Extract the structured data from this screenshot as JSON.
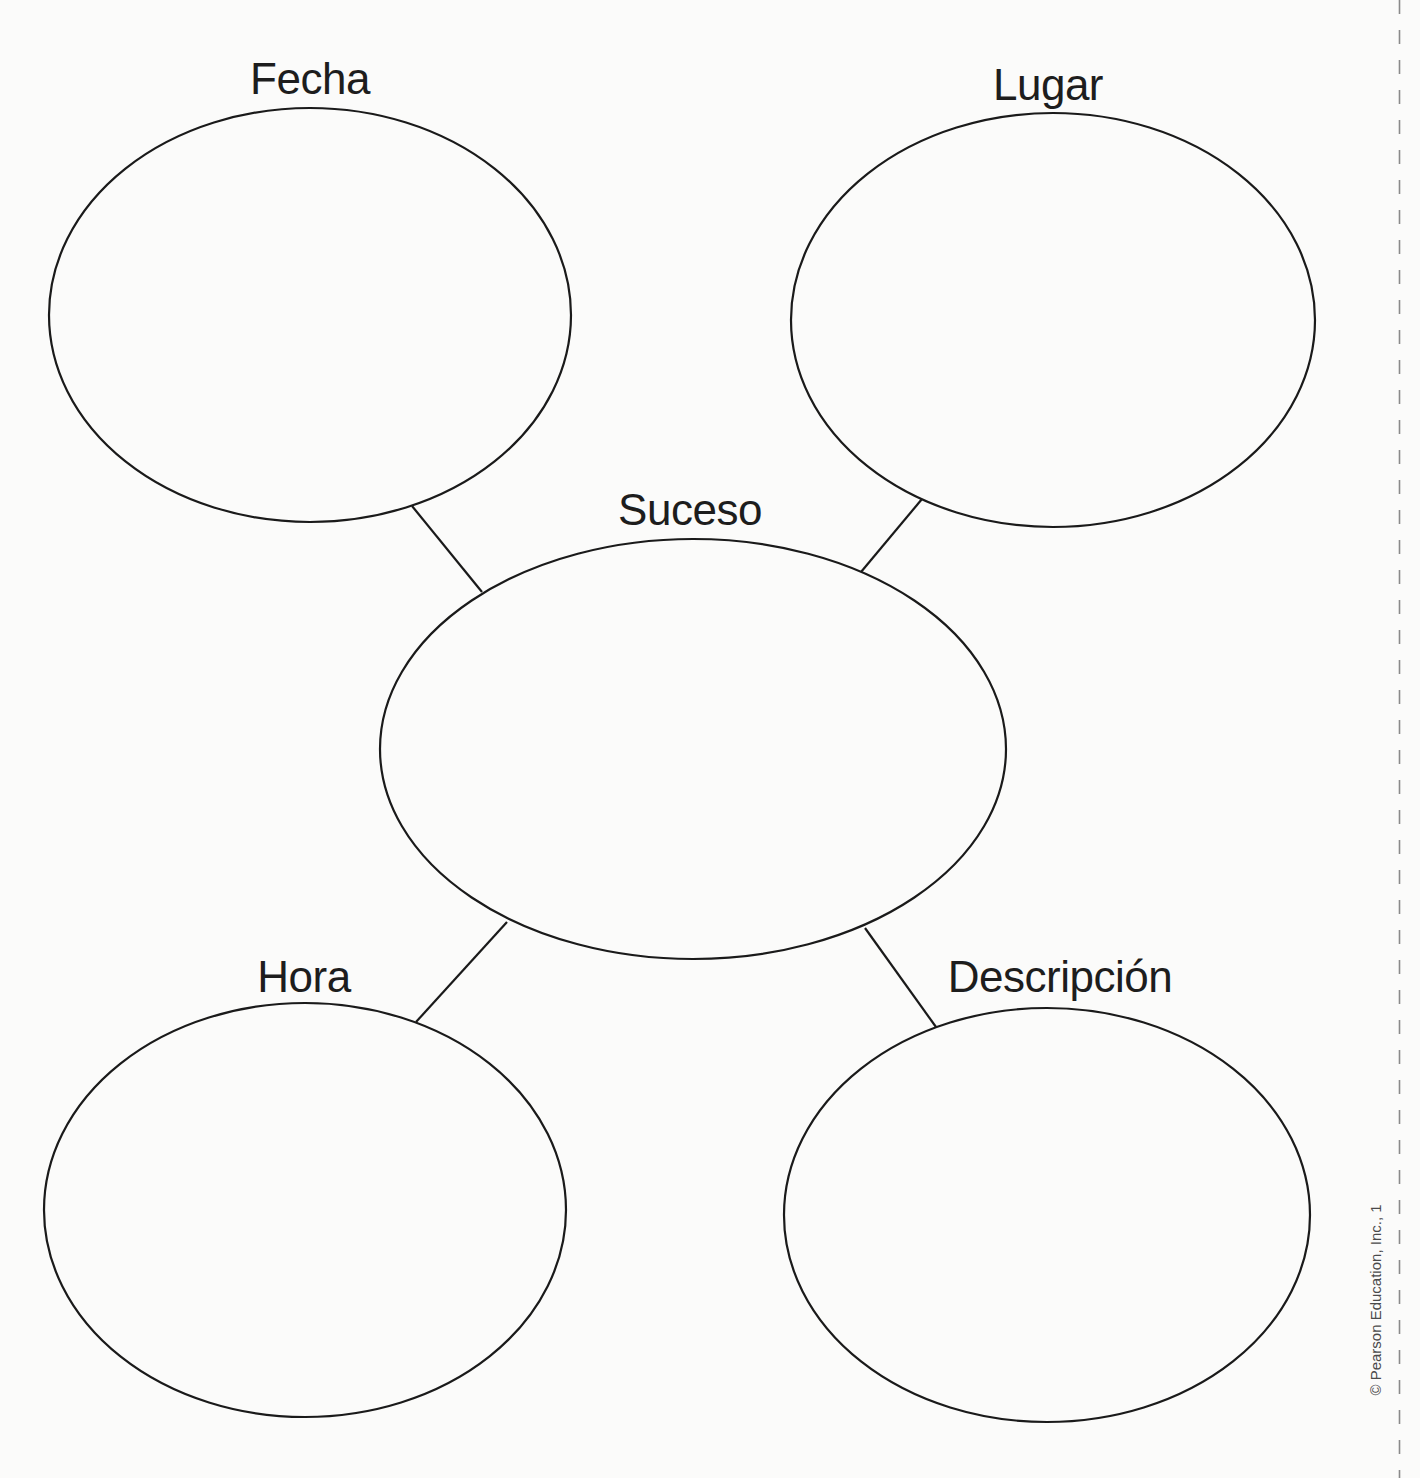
{
  "diagram": {
    "type": "web-graphic-organizer",
    "stroke_color": "#1a1a1a",
    "background_color": "#fbfbfa",
    "center_node": {
      "id": "suceso",
      "label": "Suceso",
      "cx": 693,
      "cy": 749,
      "rx": 313,
      "ry": 210,
      "label_x": 690,
      "label_y": 488
    },
    "outer_nodes": [
      {
        "id": "fecha",
        "label": "Fecha",
        "cx": 310,
        "cy": 315,
        "rx": 261,
        "ry": 207,
        "label_x": 310,
        "label_y": 57,
        "connector": {
          "x1": 412,
          "y1": 506,
          "x2": 482,
          "y2": 592
        }
      },
      {
        "id": "lugar",
        "label": "Lugar",
        "cx": 1053,
        "cy": 320,
        "rx": 262,
        "ry": 207,
        "label_x": 1048,
        "label_y": 63,
        "connector": {
          "x1": 922,
          "y1": 499,
          "x2": 861,
          "y2": 572
        }
      },
      {
        "id": "hora",
        "label": "Hora",
        "cx": 305,
        "cy": 1210,
        "rx": 261,
        "ry": 207,
        "label_x": 304,
        "label_y": 955,
        "connector": {
          "x1": 507,
          "y1": 922,
          "x2": 416,
          "y2": 1022
        }
      },
      {
        "id": "descripcion",
        "label": "Descripción",
        "cx": 1047,
        "cy": 1215,
        "rx": 263,
        "ry": 207,
        "label_x": 1060,
        "label_y": 955,
        "connector": {
          "x1": 865,
          "y1": 928,
          "x2": 936,
          "y2": 1027
        }
      }
    ]
  },
  "footer": {
    "copyright": "© Pearson Education, Inc., 1"
  }
}
